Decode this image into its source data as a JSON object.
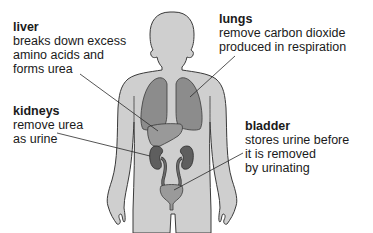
{
  "diagram": {
    "colors": {
      "body": "#cfcfcf",
      "outline": "#3a3a3a",
      "lungs": "#8c8c8c",
      "liver": "#999999",
      "kidneys": "#5e5e5e",
      "bladder": "#9a9a9a",
      "text": "#1a1a1a"
    },
    "labels": [
      {
        "id": "liver",
        "title": "liver",
        "lines": [
          "breaks down excess",
          "amino acids and",
          "forms urea"
        ]
      },
      {
        "id": "lungs",
        "title": "lungs",
        "lines": [
          "remove carbon dioxide",
          "produced in respiration"
        ]
      },
      {
        "id": "kidneys",
        "title": "kidneys",
        "lines": [
          "remove urea",
          "as urine"
        ]
      },
      {
        "id": "bladder",
        "title": "bladder",
        "lines": [
          "stores urine before",
          "it is removed",
          "by urinating"
        ]
      }
    ]
  }
}
